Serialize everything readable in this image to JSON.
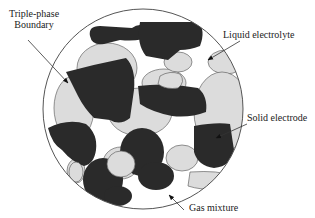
{
  "diagram": {
    "type": "three-phase porous electrode schematic",
    "colors": {
      "solid_electrode": "#2a2a2a",
      "liquid_electrolyte": "#dcdcdc",
      "gas_mixture": "#ffffff",
      "outline": "#555555"
    },
    "labels": {
      "triple_phase_line1": "Triple-phase",
      "triple_phase_line2": "Boundary",
      "liquid_electrolyte": "Liquid electrolyte",
      "solid_electrode": "Solid electrode",
      "gas_mixture": "Gas mixture"
    }
  }
}
